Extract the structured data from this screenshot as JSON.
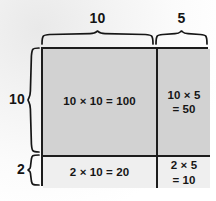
{
  "diagram": {
    "type": "area-model",
    "colors": {
      "background": "#f5f5f5",
      "top_row_fill": "#d2d2d2",
      "bottom_row_fill": "#efefef",
      "stroke": "#1c1c1c",
      "text": "#161616"
    },
    "dimensions": {
      "top_left": "10",
      "top_right": "5",
      "left_tall": "10",
      "left_short": "2"
    },
    "cells": {
      "top_left": "10 × 10 = 100",
      "top_right": "10 × 5\n= 50",
      "bottom_left": "2 × 10 = 20",
      "bottom_right": "2 × 5\n= 10"
    },
    "braces": {
      "top_left_name": "brace-top-10",
      "top_right_name": "brace-top-5",
      "left_tall_name": "brace-left-10",
      "left_short_name": "brace-left-2"
    }
  }
}
